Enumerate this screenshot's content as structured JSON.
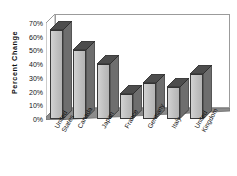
{
  "chart_data": {
    "type": "bar",
    "title": "",
    "subtitle": "",
    "xlabel": "",
    "ylabel": "Percent  Change",
    "categories": [
      "United States",
      "Canada",
      "Japan",
      "France",
      "Germany",
      "Italy",
      "United Kingdom"
    ],
    "category_lines": [
      [
        "United",
        "States"
      ],
      [
        "Canada"
      ],
      [
        "Japan"
      ],
      [
        "France"
      ],
      [
        "Germany"
      ],
      [
        "Italy"
      ],
      [
        "United",
        "Kingdom"
      ]
    ],
    "values": [
      65,
      50,
      40,
      18,
      26,
      23,
      33
    ],
    "value_labels": [
      "65%",
      "50%",
      "40%",
      "18%",
      "26%",
      "23%",
      "33%"
    ],
    "ylim": [
      0,
      70
    ],
    "ytick_values": [
      70,
      60,
      50,
      40,
      30,
      20,
      10,
      0
    ],
    "ytick_labels": [
      "70%",
      "60%",
      "50%",
      "40%",
      "30%",
      "20%",
      "10%",
      "0%"
    ],
    "grid": false,
    "legend": null,
    "legend_position": "none",
    "style": "3d-column",
    "colors": {
      "bar_front": "#c2c2c2",
      "bar_side": "#6e6e6e",
      "bar_top": "#4d4d4d",
      "floor": "#8c8c8c",
      "wall": "#ffffff",
      "outline": "#3a3a3a",
      "axis": "#9b9b9b",
      "text": "#111111",
      "background": "#ffffff"
    }
  }
}
